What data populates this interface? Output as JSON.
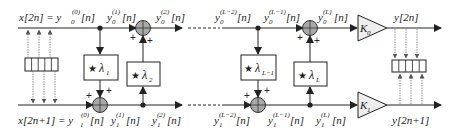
{
  "diagram": {
    "type": "lifting-scheme-block-diagram",
    "colors": {
      "line": "#222222",
      "adder_fill": "#a8a8a8",
      "gain_fill": "#eeeeee",
      "box_fill": "#ffffff",
      "dotted": "#888888"
    },
    "inputs": {
      "top": {
        "base": "x[2n] = y",
        "sub": "0",
        "sup": "(0)",
        "arg": "[n]"
      },
      "bottom": {
        "base": "x[2n+1] = y",
        "sub": "1",
        "sup": "(0)",
        "arg": "[n]"
      }
    },
    "signals_top": [
      {
        "id": "y0_1",
        "base": "y",
        "sub": "0",
        "sup": "(1)",
        "arg": "[n]"
      },
      {
        "id": "y0_2",
        "base": "y",
        "sub": "0",
        "sup": "(2)",
        "arg": "[n]"
      },
      {
        "id": "y0_Lm2",
        "base": "y",
        "sub": "0",
        "sup": "(L−2)",
        "arg": "[n]"
      },
      {
        "id": "y0_Lm1",
        "base": "y",
        "sub": "0",
        "sup": "(L−1)",
        "arg": "[n]"
      },
      {
        "id": "y0_L",
        "base": "y",
        "sub": "0",
        "sup": "(L)",
        "arg": "[n]"
      }
    ],
    "signals_bottom": [
      {
        "id": "y1_1",
        "base": "y",
        "sub": "1",
        "sup": "(1)",
        "arg": "[n]"
      },
      {
        "id": "y1_2",
        "base": "y",
        "sub": "1",
        "sup": "(2)",
        "arg": "[n]"
      },
      {
        "id": "y1_Lm2",
        "base": "y",
        "sub": "1",
        "sup": "(L−2)",
        "arg": "[n]"
      },
      {
        "id": "y1_Lm1",
        "base": "y",
        "sub": "1",
        "sup": "(L−1)",
        "arg": "[n]"
      },
      {
        "id": "y1_L",
        "base": "y",
        "sub": "1",
        "sup": "(L)",
        "arg": "[n]"
      }
    ],
    "filters": [
      {
        "id": "lambda1",
        "star": "★",
        "symbol": "λ",
        "sub": "1"
      },
      {
        "id": "lambda2",
        "star": "★",
        "symbol": "λ",
        "sub": "2"
      },
      {
        "id": "lambdaLm1",
        "star": "★",
        "symbol": "λ",
        "sub": "L−1"
      },
      {
        "id": "lambdaL",
        "star": "★",
        "symbol": "λ",
        "sub": "L"
      }
    ],
    "gains": [
      {
        "id": "K0",
        "symbol": "K",
        "sub": "0"
      },
      {
        "id": "K1",
        "symbol": "K",
        "sub": "1"
      }
    ],
    "outputs": {
      "top": "y[2n]",
      "bottom": "y[2n+1]"
    },
    "adder_sign": "+"
  }
}
